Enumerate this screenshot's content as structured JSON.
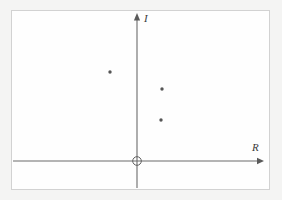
{
  "figure": {
    "title": "",
    "background_color": "#f4f4f3",
    "frame_color": "#d2d2d2",
    "axis_color": "#6b6b6b",
    "point_color": "#555555"
  },
  "axes": {
    "imaginary_label": "I",
    "real_label": "R",
    "origin_marker": "open-circle"
  },
  "chart_data": {
    "type": "scatter",
    "title": "",
    "xlabel": "R",
    "ylabel": "I",
    "grid": false,
    "legend": null,
    "annotations": [
      {
        "name": "origin",
        "symbol": "circle",
        "x": 0,
        "y": 0
      }
    ],
    "axis_style": {
      "x_axis": "arrow-right",
      "y_axis": "arrow-up",
      "ticks": [],
      "tick_labels": []
    },
    "xlim": [
      -3.6,
      3.8
    ],
    "ylim": [
      -0.8,
      4.6
    ],
    "series": [
      {
        "name": "poles",
        "marker": "dot",
        "points": [
          {
            "x": -1.0,
            "y": 3.0,
            "px": 110,
            "py": 72
          },
          {
            "x": 1.0,
            "y": 2.3,
            "px": 162,
            "py": 89
          },
          {
            "x": 1.0,
            "y": 1.4,
            "px": 161,
            "py": 120
          }
        ]
      }
    ]
  }
}
